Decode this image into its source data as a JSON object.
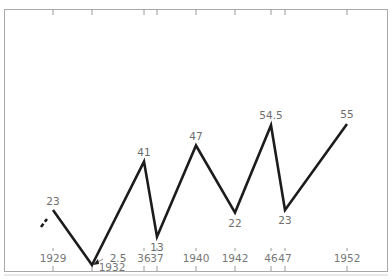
{
  "chart_data": {
    "type": "line",
    "title": "",
    "xlabel": "",
    "ylabel": "",
    "grid": false,
    "legend": null,
    "x": [
      "1929",
      "1932",
      "1936",
      "1937",
      "1940",
      "1942",
      "1946",
      "1947",
      "1952"
    ],
    "tick_labels": [
      "1929",
      "1932",
      "36",
      "37",
      "1940",
      "1942",
      "46",
      "47",
      "1952"
    ],
    "series": [
      {
        "name": "series",
        "values": [
          23,
          2.5,
          41,
          13,
          47,
          22,
          54.5,
          23,
          55
        ],
        "value_labels": [
          "23",
          "2.5",
          "41",
          "13",
          "47",
          "22",
          "54.5",
          "23",
          "55"
        ],
        "leading_segment": "dashed"
      }
    ],
    "ylim": [
      0,
      60
    ]
  },
  "colors": {
    "line": "#1c1c1c",
    "frame": "#a9a9a9",
    "text": "#6d6d6d",
    "background": "#ffffff"
  }
}
